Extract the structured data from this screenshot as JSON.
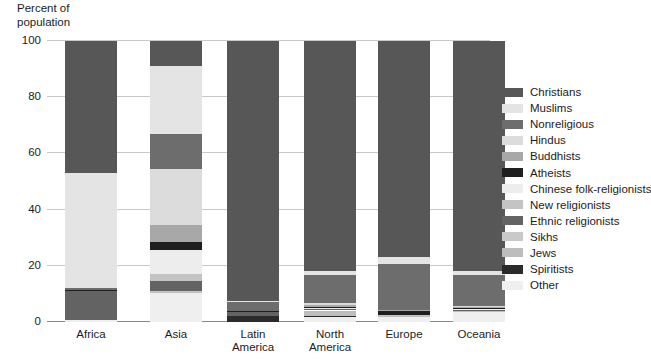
{
  "chart_data": {
    "type": "bar",
    "title": "",
    "subtitle": "",
    "xlabel": "",
    "ylabel": "Percent of\npopulation",
    "ylim": [
      0,
      100
    ],
    "yticks": [
      0,
      20,
      40,
      60,
      80,
      100
    ],
    "grid": true,
    "stacked": true,
    "legend_position": "right",
    "categories": [
      "Africa",
      "Asia",
      "Latin\nAmerica",
      "North\nAmerica",
      "Europe",
      "Oceania"
    ],
    "series": [
      {
        "name": "Christians",
        "color": "#575757",
        "values": [
          47.0,
          9.0,
          92.6,
          81.8,
          76.8,
          82.0
        ]
      },
      {
        "name": "Muslims",
        "color": "#e4e4e4",
        "values": [
          41.0,
          24.0,
          0.3,
          1.6,
          2.4,
          1.3
        ]
      },
      {
        "name": "Nonreligious",
        "color": "#6d6d6d",
        "values": [
          0.5,
          12.5,
          3.1,
          10.0,
          16.5,
          11.0
        ]
      },
      {
        "name": "Hindus",
        "color": "#dcdcdc",
        "values": [
          0.2,
          20.0,
          0.1,
          0.4,
          0.2,
          0.4
        ]
      },
      {
        "name": "Buddhists",
        "color": "#a8a8a8",
        "values": [
          0.0,
          6.0,
          0.1,
          0.7,
          0.3,
          0.4
        ]
      },
      {
        "name": "Atheists",
        "color": "#1f1f1f",
        "values": [
          0.1,
          3.0,
          0.1,
          0.5,
          1.4,
          0.3
        ]
      },
      {
        "name": "Chinese folk-religionists",
        "color": "#ededed",
        "values": [
          0.0,
          8.5,
          0.1,
          0.2,
          0.0,
          0.2
        ]
      },
      {
        "name": "New religionists",
        "color": "#c4c4c4",
        "values": [
          0.0,
          2.5,
          0.1,
          0.3,
          0.1,
          0.2
        ]
      },
      {
        "name": "Ethnic religionists",
        "color": "#636363",
        "values": [
          10.5,
          3.3,
          1.2,
          0.2,
          0.1,
          0.3
        ]
      },
      {
        "name": "Sikhs",
        "color": "#c9c9c9",
        "values": [
          0.0,
          0.5,
          0.0,
          0.2,
          0.1,
          0.1
        ]
      },
      {
        "name": "Jews",
        "color": "#bdbdbd",
        "values": [
          0.0,
          0.3,
          0.3,
          2.0,
          0.3,
          0.3
        ]
      },
      {
        "name": "Spiritists",
        "color": "#2b2b2b",
        "values": [
          0.0,
          0.0,
          1.9,
          0.2,
          0.0,
          0.0
        ]
      },
      {
        "name": "Other",
        "color": "#efefef",
        "values": [
          0.7,
          10.4,
          0.1,
          1.9,
          1.8,
          3.5
        ]
      }
    ]
  }
}
